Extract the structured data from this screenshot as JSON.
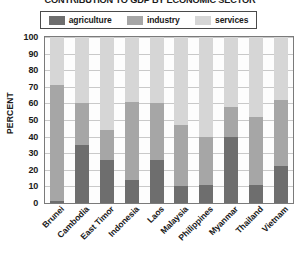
{
  "chart_data": {
    "type": "bar",
    "subtype": "stacked-bar-100",
    "title": "CONTRIBUTION TO GDP BY ECONOMIC SECTOR",
    "xlabel": "",
    "ylabel": "PERCENT",
    "ylim": [
      0,
      100
    ],
    "ytick_step": 10,
    "yticks": [
      "100",
      "90",
      "80",
      "70",
      "60",
      "50",
      "40",
      "30",
      "20",
      "10",
      "0"
    ],
    "grid": true,
    "legend_position": "top",
    "categories": [
      "Brunei",
      "Cambodia",
      "East Timor",
      "Indonesia",
      "Laos",
      "Malaysia",
      "Philippines",
      "Myanmar",
      "Thailand",
      "Vietnam"
    ],
    "series": [
      {
        "name": "agriculture",
        "color": "#6e6e6e",
        "values": [
          1,
          35,
          26,
          14,
          26,
          10,
          11,
          40,
          11,
          22
        ]
      },
      {
        "name": "industry",
        "color": "#a6a6a6",
        "values": [
          70,
          25,
          18,
          47,
          34,
          37,
          29,
          18,
          41,
          40
        ]
      },
      {
        "name": "services",
        "color": "#d6d6d6",
        "values": [
          29,
          40,
          56,
          39,
          40,
          53,
          60,
          42,
          48,
          38
        ]
      }
    ]
  },
  "legend": {
    "items": [
      {
        "label": "agriculture",
        "color": "#6e6e6e"
      },
      {
        "label": "industry",
        "color": "#a6a6a6"
      },
      {
        "label": "services",
        "color": "#d6d6d6"
      }
    ]
  },
  "colors": {
    "agriculture": "#6e6e6e",
    "industry": "#a6a6a6",
    "services": "#d6d6d6",
    "gridline": "#c9c9c9",
    "axis": "#7a7a7a",
    "text": "#1a1a1a",
    "background": "#ffffff"
  }
}
